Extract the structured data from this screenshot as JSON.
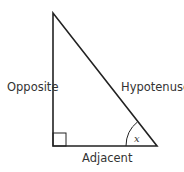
{
  "diagram": {
    "type": "right-triangle",
    "labels": {
      "opposite": "Opposite",
      "hypotenuse": "Hypotenuse",
      "adjacent": "Adjacent",
      "angle": "x"
    },
    "colors": {
      "stroke": "#222222",
      "text": "#333333",
      "background": "#ffffff"
    }
  }
}
